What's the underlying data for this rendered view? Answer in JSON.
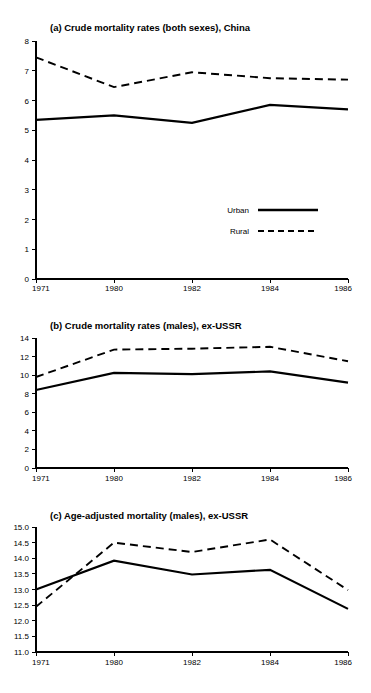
{
  "figure": {
    "background_color": "#ffffff",
    "ink_color": "#000000"
  },
  "legend": {
    "position": "inside-panel-a-lower-right",
    "entries": [
      {
        "label": "Urban",
        "style": "solid",
        "icon": "solid-line-swatch"
      },
      {
        "label": "Rural",
        "style": "dashed",
        "icon": "dashed-line-swatch"
      }
    ]
  },
  "chart_data": [
    {
      "type": "line",
      "panel": "a",
      "title": "(a) Crude mortality rates (both sexes), China",
      "xlabel": "",
      "ylabel": "",
      "x": [
        "1971",
        "1980",
        "1982",
        "1984",
        "1986"
      ],
      "categories": [
        "1971",
        "1980",
        "1982",
        "1984",
        "1986"
      ],
      "xtick_labels": [
        "1971",
        "1980",
        "1982",
        "1984",
        "1986"
      ],
      "ytick_labels": [
        "0",
        "1",
        "2",
        "3",
        "4",
        "5",
        "6",
        "7",
        "8"
      ],
      "yticks": [
        0,
        1,
        2,
        3,
        4,
        5,
        6,
        7,
        8
      ],
      "ylim": [
        0,
        8
      ],
      "grid": false,
      "legend_position": "lower right",
      "series": [
        {
          "name": "Urban",
          "style": "solid",
          "values": [
            5.35,
            5.5,
            5.25,
            5.85,
            5.7
          ]
        },
        {
          "name": "Rural",
          "style": "dashed",
          "values": [
            7.45,
            6.45,
            6.95,
            6.75,
            6.7
          ]
        }
      ]
    },
    {
      "type": "line",
      "panel": "b",
      "title": "(b) Crude mortality rates (males), ex-USSR",
      "xlabel": "",
      "ylabel": "",
      "x": [
        "1971",
        "1980",
        "1982",
        "1984",
        "1986"
      ],
      "categories": [
        "1971",
        "1980",
        "1982",
        "1984",
        "1986"
      ],
      "xtick_labels": [
        "1971",
        "1980",
        "1982",
        "1984",
        "1986"
      ],
      "ytick_labels": [
        "0",
        "2",
        "4",
        "6",
        "8",
        "10",
        "12",
        "14"
      ],
      "yticks": [
        0,
        2,
        4,
        6,
        8,
        10,
        12,
        14
      ],
      "ylim": [
        0,
        14
      ],
      "grid": false,
      "legend_position": "none",
      "series": [
        {
          "name": "Urban",
          "style": "solid",
          "values": [
            8.4,
            10.25,
            10.1,
            10.4,
            9.2
          ]
        },
        {
          "name": "Rural",
          "style": "dashed",
          "values": [
            9.8,
            12.75,
            12.85,
            13.05,
            11.5
          ]
        }
      ]
    },
    {
      "type": "line",
      "panel": "c",
      "title": "(c) Age-adjusted mortality (males), ex-USSR",
      "xlabel": "",
      "ylabel": "",
      "x": [
        "1971",
        "1980",
        "1982",
        "1984",
        "1986"
      ],
      "categories": [
        "1971",
        "1980",
        "1982",
        "1984",
        "1986"
      ],
      "xtick_labels": [
        "1971",
        "1980",
        "1982",
        "1984",
        "1986"
      ],
      "ytick_labels": [
        "11.0",
        "11.5",
        "12.0",
        "12.5",
        "13.0",
        "13.5",
        "14.0",
        "14.5",
        "15.0"
      ],
      "yticks": [
        11.0,
        11.5,
        12.0,
        12.5,
        13.0,
        13.5,
        14.0,
        14.5,
        15.0
      ],
      "ylim": [
        11.0,
        15.0
      ],
      "grid": false,
      "legend_position": "none",
      "series": [
        {
          "name": "Urban",
          "style": "solid",
          "values": [
            13.0,
            13.92,
            13.48,
            13.63,
            12.38
          ]
        },
        {
          "name": "Rural",
          "style": "dashed",
          "values": [
            12.45,
            14.5,
            14.2,
            14.6,
            12.98
          ]
        }
      ]
    }
  ]
}
